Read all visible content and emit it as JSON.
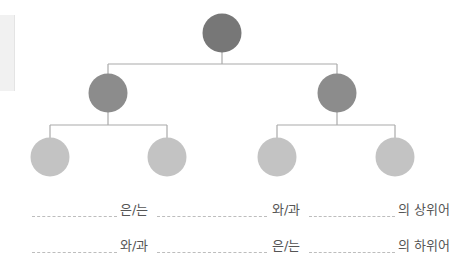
{
  "diagram": {
    "type": "hierarchy-tree",
    "colors": {
      "root": "#777777",
      "level1": "#8c8c8c",
      "level2": "#c3c3c3",
      "line": "#aaaaaa"
    },
    "nodes": [
      {
        "id": "root",
        "level": 0
      },
      {
        "id": "left-child",
        "level": 1,
        "parent": "root"
      },
      {
        "id": "right-child",
        "level": 1,
        "parent": "root"
      },
      {
        "id": "left-leaf-1",
        "level": 2,
        "parent": "left-child"
      },
      {
        "id": "left-leaf-2",
        "level": 2,
        "parent": "left-child"
      },
      {
        "id": "right-leaf-1",
        "level": 2,
        "parent": "right-child"
      },
      {
        "id": "right-leaf-2",
        "level": 2,
        "parent": "right-child"
      }
    ]
  },
  "sentences": [
    {
      "particle1": "은/는",
      "particle2": "와/과",
      "ending": "의 상위어"
    },
    {
      "particle1": "와/과",
      "particle2": "은/는",
      "ending": "의 하위어"
    }
  ]
}
